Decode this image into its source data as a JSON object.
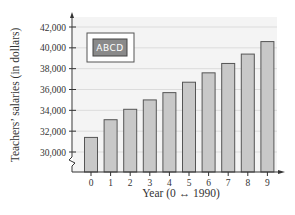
{
  "chart_data": {
    "type": "bar",
    "title": "",
    "xlabel": "Year (0 ↔ 1990)",
    "ylabel": "Teachers’ salaries (in dollars)",
    "categories": [
      "0",
      "1",
      "2",
      "3",
      "4",
      "5",
      "6",
      "7",
      "8",
      "9"
    ],
    "values": [
      31400,
      33100,
      34100,
      35000,
      35700,
      36700,
      37600,
      38500,
      39400,
      40600
    ],
    "ylim": [
      29000,
      42800
    ],
    "yticks": [
      30000,
      32000,
      34000,
      36000,
      38000,
      40000,
      42000
    ],
    "ytick_labels": [
      "30,000",
      "32,000",
      "34,000",
      "36,000",
      "38,000",
      "40,000",
      "42,000"
    ],
    "y_axis_break": true,
    "grid": true,
    "legend_box": {
      "text": "ABCD",
      "placement": "top-left"
    },
    "colors": {
      "bar_fill": "#c8c8c8",
      "bar_stroke": "#555555",
      "plot_bg": "#f4f4f4",
      "grid": "#dcdcdc",
      "axis": "#333333",
      "legend_fill": "#8a8a8a"
    }
  }
}
